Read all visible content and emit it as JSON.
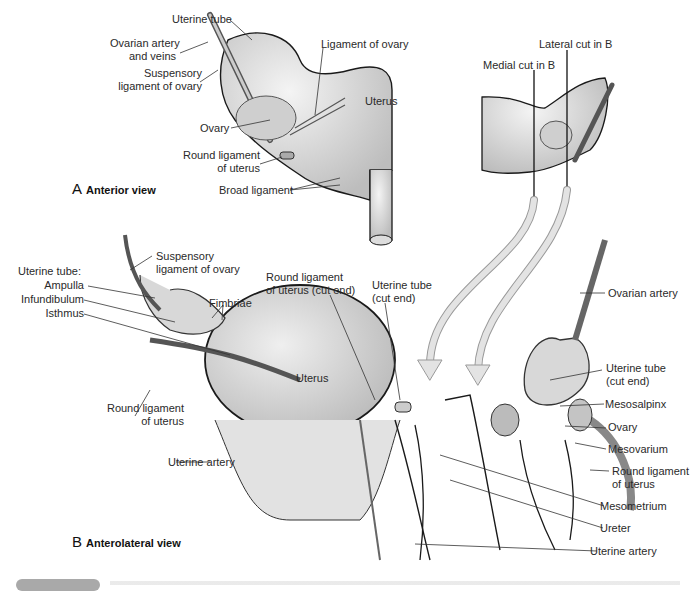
{
  "figure": {
    "panel_a": {
      "title_letter": "A",
      "title": "Anterior view",
      "labels": {
        "uterine_tube": "Uterine tube",
        "ovarian_artery_veins_1": "Ovarian artery",
        "ovarian_artery_veins_2": "and veins",
        "ligament_of_ovary": "Ligament of ovary",
        "suspensory_1": "Suspensory",
        "suspensory_2": "ligament of ovary",
        "uterus": "Uterus",
        "ovary": "Ovary",
        "round_ligament_1": "Round ligament",
        "round_ligament_2": "of uterus",
        "broad_ligament": "Broad ligament",
        "lateral_cut": "Lateral cut in B",
        "medial_cut": "Medial cut in B"
      }
    },
    "panel_b": {
      "title_letter": "B",
      "title": "Anterolateral view",
      "labels": {
        "suspensory_1": "Suspensory",
        "suspensory_2": "ligament of ovary",
        "uterine_tube_heading": "Uterine tube:",
        "ampulla": "Ampulla",
        "infundibulum": "Infundibulum",
        "isthmus": "Isthmus",
        "fimbriae": "Fimbriae",
        "round_lig_cut_1": "Round ligament",
        "round_lig_cut_2": "of uterus (cut end)",
        "uterine_tube_cut_1": "Uterine tube",
        "uterine_tube_cut_2": "(cut end)",
        "ovarian_artery": "Ovarian artery",
        "uterus": "Uterus",
        "round_ligament_left_1": "Round ligament",
        "round_ligament_left_2": "of uterus",
        "uterine_artery_left": "Uterine artery",
        "uterine_tube_cut_right_1": "Uterine tube",
        "uterine_tube_cut_right_2": "(cut end)",
        "mesosalpinx": "Mesosalpinx",
        "ovary": "Ovary",
        "mesovarium": "Mesovarium",
        "round_ligament_right_1": "Round ligament",
        "round_ligament_right_2": "of uterus",
        "mesometrium": "Mesometrium",
        "ureter": "Ureter",
        "uterine_artery_right": "Uterine artery"
      }
    },
    "colors": {
      "tissue": "#e6e6e6",
      "outline": "#1a1a1a",
      "arrow": "#d4d4d4",
      "caption_badge": "#a9a9a9"
    }
  }
}
